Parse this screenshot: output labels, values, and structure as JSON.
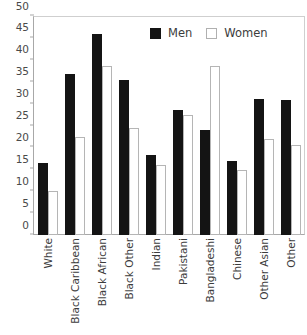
{
  "chart_data": {
    "type": "bar",
    "title": "",
    "xlabel": "",
    "ylabel": "",
    "ylim": [
      0,
      50
    ],
    "yticks": [
      0,
      5,
      10,
      15,
      20,
      25,
      30,
      35,
      40,
      45,
      50
    ],
    "grid": false,
    "legend_position": "top-right",
    "categories": [
      "White",
      "Black Caribbean",
      "Black African",
      "Black Other",
      "Indian",
      "Pakistani",
      "Bangladeshi",
      "Chinese",
      "Other Asian",
      "Other"
    ],
    "series": [
      {
        "name": "Men",
        "color": "#141414",
        "values": [
          16.5,
          36.8,
          46.0,
          35.4,
          18.3,
          28.5,
          24.0,
          17.0,
          31.0,
          30.8
        ]
      },
      {
        "name": "Women",
        "color": "#ffffff",
        "values": [
          10.0,
          22.3,
          38.7,
          24.5,
          16.0,
          27.5,
          38.7,
          14.8,
          22.0,
          20.6
        ]
      }
    ]
  },
  "legend": {
    "items": [
      {
        "label": "Men",
        "swatch": "filled-square-icon"
      },
      {
        "label": "Women",
        "swatch": "outlined-square-icon"
      }
    ]
  },
  "title_clip": {
    "text": ""
  }
}
